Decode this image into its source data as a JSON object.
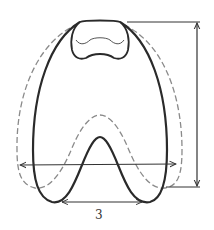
{
  "diagram": {
    "labels": {
      "bottom_dimension": "3"
    },
    "colors": {
      "solid_outline": "#2a2a2a",
      "dashed_outline": "#8a8a8a",
      "arrows": "#333333",
      "background": "#ffffff"
    },
    "dimensions": [
      {
        "id": "overall-width",
        "orientation": "horizontal",
        "label": ""
      },
      {
        "id": "overall-height",
        "orientation": "vertical",
        "label": ""
      },
      {
        "id": "inner-gap-width",
        "orientation": "horizontal",
        "label": "3"
      }
    ]
  }
}
